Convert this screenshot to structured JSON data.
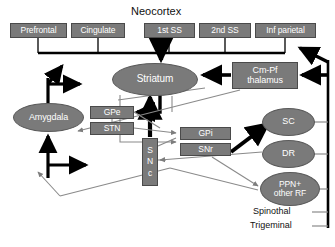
{
  "figure": {
    "title": "Neocortex",
    "bottom_labels": [
      "Spinothal",
      "Trigeminal"
    ]
  },
  "cortex": {
    "heading": "Neocortex",
    "areas": [
      {
        "id": "prefrontal",
        "label": "Prefrontal",
        "x": 10,
        "y": 23,
        "w": 57,
        "h": 15
      },
      {
        "id": "cingulate",
        "label": "Cingulate",
        "x": 71,
        "y": 23,
        "w": 54,
        "h": 15
      },
      {
        "id": "first-ss",
        "label": "1st  SS",
        "x": 144,
        "y": 23,
        "w": 51,
        "h": 15
      },
      {
        "id": "second-ss",
        "label": "2nd SS",
        "x": 199,
        "y": 23,
        "w": 52,
        "h": 15
      },
      {
        "id": "inf-parietal",
        "label": "Inf parietal",
        "x": 255,
        "y": 23,
        "w": 61,
        "h": 15
      }
    ]
  },
  "nuclei": {
    "striatum": {
      "label": "Striatum",
      "shape": "ellipse",
      "x": 112,
      "y": 63,
      "w": 86,
      "h": 33
    },
    "amygdala": {
      "label": "Amygdala",
      "shape": "ellipse",
      "x": 13,
      "y": 103,
      "w": 71,
      "h": 29
    },
    "thalamus": {
      "label": "Cm-Pf\nthalamus",
      "shape": "box",
      "x": 232,
      "y": 62,
      "w": 66,
      "h": 27,
      "line1": "Cm-Pf",
      "line2": "thalamus"
    },
    "gpe": {
      "label": "GPe",
      "shape": "box",
      "x": 90,
      "y": 106,
      "w": 44,
      "h": 13
    },
    "stn": {
      "label": "STN",
      "shape": "box",
      "x": 90,
      "y": 122,
      "w": 44,
      "h": 13
    },
    "gpi": {
      "label": "GPi",
      "shape": "box",
      "x": 180,
      "y": 127,
      "w": 51,
      "h": 13
    },
    "snr": {
      "label": "SNr",
      "shape": "box",
      "x": 180,
      "y": 143,
      "w": 51,
      "h": 13
    },
    "snc": {
      "label": "SNc",
      "shape": "box",
      "x": 142,
      "y": 138,
      "w": 16,
      "h": 48,
      "letters": [
        "S",
        "N",
        "c"
      ]
    },
    "sc": {
      "label": "SC",
      "shape": "ellipse",
      "x": 262,
      "y": 108,
      "w": 53,
      "h": 28
    },
    "dr": {
      "label": "DR",
      "shape": "ellipse",
      "x": 262,
      "y": 140,
      "w": 53,
      "h": 28
    },
    "ppn": {
      "label": "PPN+\nother RF",
      "shape": "ellipse",
      "x": 260,
      "y": 172,
      "w": 60,
      "h": 34,
      "line1": "PPN+",
      "line2": "other RF"
    }
  },
  "sensory_inputs": {
    "spinothalamic": "Spinothal",
    "trigeminal": "Trigeminal"
  },
  "colors": {
    "node_fill": "#7a7a7a",
    "node_text": "#ffffff",
    "page_background": "#ffffff",
    "bold_connection": "#000000",
    "thin_connection": "#888888",
    "plain_text": "#111111"
  }
}
